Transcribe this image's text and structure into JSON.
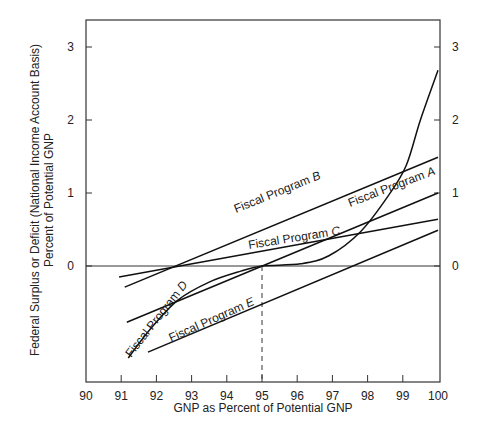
{
  "chart_data": {
    "type": "line",
    "title": "",
    "xlabel": "GNP as Percent of Potential GNP",
    "ylabel_line1": "Federal Surplus or Deficit (National Income Account Basis)",
    "ylabel_line2": "Percent of Potential GNP",
    "xlim": [
      90,
      100
    ],
    "ylim": [
      -1.58,
      3.4
    ],
    "x_ticks": [
      90,
      91,
      92,
      93,
      94,
      95,
      96,
      97,
      98,
      99,
      100
    ],
    "y_ticks": [
      0,
      1,
      2,
      3
    ],
    "y_ticks_right": [
      0,
      1,
      2,
      3
    ],
    "grid": false,
    "reference_lines": {
      "horizontal_zero": 0,
      "vertical_dashed_x": 95
    },
    "series": [
      {
        "name": "Fiscal Program A",
        "label": "Fiscal Program A",
        "x": [
          91.16,
          100
        ],
        "y": [
          -0.77,
          1.0
        ]
      },
      {
        "name": "Fiscal Program B",
        "label": "Fiscal Program B",
        "x": [
          91.1,
          100
        ],
        "y": [
          -0.29,
          1.49
        ]
      },
      {
        "name": "Fiscal Program C",
        "label": "Fiscal Program C",
        "x": [
          90.94,
          100
        ],
        "y": [
          -0.15,
          0.64
        ]
      },
      {
        "name": "Fiscal Program D",
        "label": "Fiscal Program D",
        "x": [
          91.2,
          91.8,
          92.6,
          93.5,
          94.4,
          95.0,
          96.1,
          96.9,
          97.8,
          98.6,
          99.1,
          99.5,
          100
        ],
        "y": [
          -1.26,
          -0.88,
          -0.47,
          -0.22,
          -0.07,
          0.0,
          0.03,
          0.14,
          0.47,
          0.97,
          1.38,
          2.0,
          2.68
        ]
      },
      {
        "name": "Fiscal Program E",
        "label": "Fiscal Program E",
        "x": [
          91.76,
          100
        ],
        "y": [
          -1.18,
          0.49
        ]
      }
    ]
  }
}
